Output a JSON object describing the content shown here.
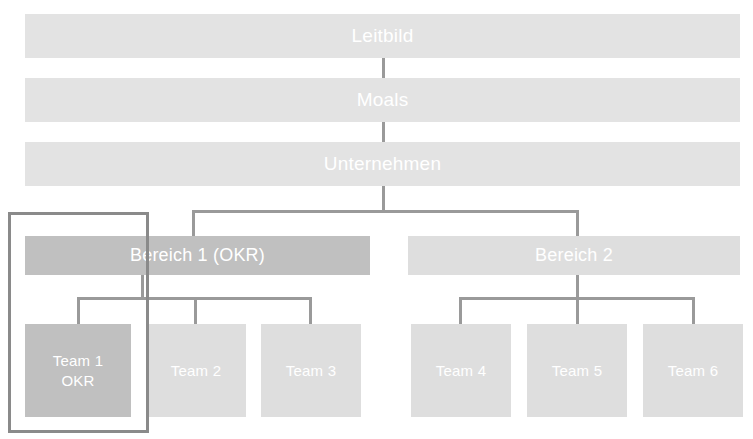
{
  "diagram": {
    "type": "org-cascade",
    "levels": [
      {
        "id": "leitbild",
        "label": "Leitbild"
      },
      {
        "id": "moals",
        "label": "Moals"
      },
      {
        "id": "unternehmen",
        "label": "Unternehmen"
      }
    ],
    "departments": [
      {
        "id": "bereich-1",
        "label": "Bereich 1 (OKR)"
      },
      {
        "id": "bereich-2",
        "label": "Bereich 2"
      }
    ],
    "teams": [
      {
        "id": "team-1",
        "label_line1": "Team 1",
        "label_line2": "OKR",
        "parent": "bereich-1",
        "emphasis": true
      },
      {
        "id": "team-2",
        "label_line1": "Team 2",
        "label_line2": "",
        "parent": "bereich-1",
        "emphasis": false
      },
      {
        "id": "team-3",
        "label_line1": "Team 3",
        "label_line2": "",
        "parent": "bereich-1",
        "emphasis": false
      },
      {
        "id": "team-4",
        "label_line1": "Team 4",
        "label_line2": "",
        "parent": "bereich-2",
        "emphasis": false
      },
      {
        "id": "team-5",
        "label_line1": "Team 5",
        "label_line2": "",
        "parent": "bereich-2",
        "emphasis": false
      },
      {
        "id": "team-6",
        "label_line1": "Team 6",
        "label_line2": "",
        "parent": "bereich-2",
        "emphasis": false
      }
    ],
    "highlight": {
      "id": "okr-scope-frame",
      "covers": [
        "bereich-1",
        "team-1"
      ]
    },
    "colors": {
      "background": "#ffffff",
      "box_pale": "#e3e3e3",
      "box_light": "#dedede",
      "box_mid": "#d2d2d2",
      "box_dark": "#c0c0c0",
      "label_text": "#ffffff",
      "connector": "#9a9a9a",
      "highlight_border": "#8a8a8a"
    }
  }
}
